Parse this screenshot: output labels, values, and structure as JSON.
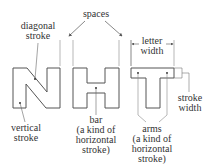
{
  "diagram": {
    "letters": [
      "N",
      "H",
      "T"
    ],
    "labels": {
      "spaces": "spaces",
      "diagonal_stroke": [
        "diagonal",
        "stroke"
      ],
      "vertical_stroke": [
        "vertical",
        "stroke"
      ],
      "bar": [
        "bar",
        "(a kind of",
        "horizontal",
        "stroke)"
      ],
      "letter_width": [
        "letter",
        "width"
      ],
      "stroke_width": [
        "stroke",
        "width"
      ],
      "arms": [
        "arms",
        "(a kind of",
        "horizontal",
        "stroke)"
      ]
    },
    "colors": {
      "outline": "#555555",
      "leader": "#666666",
      "text": "#333333"
    }
  }
}
